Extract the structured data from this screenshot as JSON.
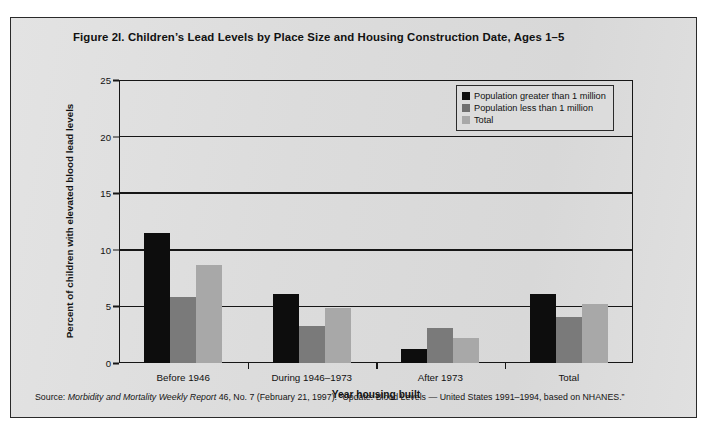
{
  "figure": {
    "title": "Figure 2l. Children’s Lead Levels by Place Size and Housing Construction Date, Ages 1–5",
    "source_prefix": "Source: ",
    "source_italic": "Morbidity and Mortality Weekly Report",
    "source_rest": " 46, No. 7 (February 21, 1997).  “Update: Blood Levels — United States 1991–1994, based on NHANES.”"
  },
  "colors": {
    "series_greater_1m": "#0d0d0d",
    "series_less_1m": "#7a7a7a",
    "series_total": "#a8a8a8",
    "page_background": "#ffffff",
    "panel_background": "#dedede",
    "axis": "#161616"
  },
  "chart_data": {
    "type": "bar",
    "title": "Figure 2l. Children’s Lead Levels by Place Size and Housing Construction Date, Ages 1–5",
    "xlabel": "Year housing built",
    "ylabel": "Percent of children with elevated blood lead levels",
    "categories": [
      "Before 1946",
      "During 1946–1973",
      "After 1973",
      "Total"
    ],
    "series": [
      {
        "name": "Population greater than 1 million",
        "values": [
          11.5,
          6.1,
          1.2,
          6.1
        ]
      },
      {
        "name": "Population less than 1 million",
        "values": [
          5.8,
          3.3,
          3.1,
          4.1
        ]
      },
      {
        "name": "Total",
        "values": [
          8.7,
          4.9,
          2.2,
          5.2
        ]
      }
    ],
    "ylim": [
      0,
      25
    ],
    "yticks": [
      0,
      5,
      10,
      15,
      20,
      25
    ],
    "ytick_labels": [
      "0",
      "5",
      "10",
      "15",
      "20",
      "25"
    ],
    "grid": true,
    "legend_position": "top-right"
  }
}
